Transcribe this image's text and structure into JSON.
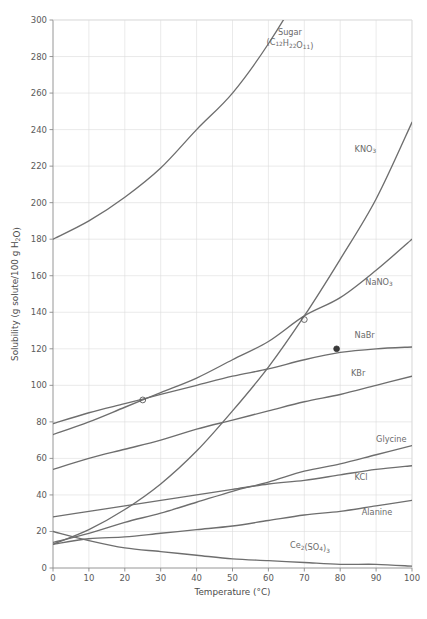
{
  "chart_data": {
    "type": "line",
    "title": "",
    "xlabel": "Temperature (°C)",
    "ylabel": "Solubility (g solute/100 g H₂O)",
    "xlim": [
      0,
      100
    ],
    "ylim": [
      0,
      300
    ],
    "xticks": [
      0,
      10,
      20,
      30,
      40,
      50,
      60,
      70,
      80,
      90,
      100
    ],
    "yticks": [
      0,
      20,
      40,
      60,
      80,
      100,
      120,
      140,
      160,
      180,
      200,
      220,
      240,
      260,
      280,
      300
    ],
    "grid": true,
    "legend_position": "inline-labels",
    "line_color": "#6e6e6e",
    "grid_color": "#dcdcdc",
    "axis_color": "#8a8a8a",
    "series": [
      {
        "name": "Sugar",
        "label_line1": "Sugar",
        "label_line2": "(C12 H22 O11 )",
        "label_formula": "(C₁₂H₂₂O₁₁)",
        "label_x": 66,
        "label_y": 292,
        "x": [
          0,
          10,
          20,
          30,
          40,
          50,
          60,
          70,
          80,
          90,
          100
        ],
        "values": [
          180,
          190,
          203,
          219,
          240,
          260,
          287,
          320,
          360,
          410,
          470
        ]
      },
      {
        "name": "KNO3",
        "label": "KNO₃",
        "label_x": 84,
        "label_y": 228,
        "x": [
          0,
          10,
          20,
          30,
          40,
          50,
          60,
          70,
          80,
          90,
          100
        ],
        "values": [
          13,
          21,
          32,
          46,
          64,
          86,
          110,
          138,
          169,
          202,
          244
        ]
      },
      {
        "name": "NaNO3",
        "label": "NaNO₃",
        "label_x": 87,
        "label_y": 155,
        "x": [
          0,
          10,
          20,
          30,
          40,
          50,
          60,
          70,
          80,
          90,
          100
        ],
        "values": [
          73,
          80,
          88,
          96,
          104,
          114,
          124,
          138,
          148,
          163,
          180
        ]
      },
      {
        "name": "NaBr",
        "label": "NaBr",
        "label_x": 84,
        "label_y": 126,
        "x": [
          0,
          10,
          20,
          30,
          40,
          50,
          60,
          70,
          80,
          90,
          100
        ],
        "values": [
          79,
          85,
          90,
          95,
          100,
          105,
          109,
          114,
          118,
          120,
          121
        ]
      },
      {
        "name": "KBr",
        "label": "KBr",
        "label_x": 83,
        "label_y": 105,
        "x": [
          0,
          10,
          20,
          30,
          40,
          50,
          60,
          70,
          80,
          90,
          100
        ],
        "values": [
          54,
          60,
          65,
          70,
          76,
          81,
          86,
          91,
          95,
          100,
          105
        ]
      },
      {
        "name": "Glycine",
        "label": "Glycine",
        "label_x": 90,
        "label_y": 69,
        "x": [
          0,
          10,
          20,
          30,
          40,
          50,
          60,
          70,
          80,
          90,
          100
        ],
        "values": [
          14,
          19,
          25,
          30,
          36,
          42,
          47,
          53,
          57,
          62,
          67
        ]
      },
      {
        "name": "KCl",
        "label": "KCl",
        "label_x": 84,
        "label_y": 48,
        "x": [
          0,
          10,
          20,
          30,
          40,
          50,
          60,
          70,
          80,
          90,
          100
        ],
        "values": [
          28,
          31,
          34,
          37,
          40,
          43,
          46,
          48,
          51,
          54,
          56
        ]
      },
      {
        "name": "Alanine",
        "label": "Alanine",
        "label_x": 86,
        "label_y": 29,
        "x": [
          0,
          10,
          20,
          30,
          40,
          50,
          60,
          70,
          80,
          90,
          100
        ],
        "values": [
          13,
          16,
          17,
          19,
          21,
          23,
          26,
          29,
          31,
          34,
          37
        ]
      },
      {
        "name": "Ce2(SO4)3",
        "label": "Ce₂(SO₄)₃",
        "label_x": 66,
        "label_y": 11,
        "x": [
          0,
          10,
          20,
          30,
          40,
          50,
          60,
          70,
          80,
          90,
          100
        ],
        "values": [
          20,
          15,
          11,
          9,
          7,
          5,
          4,
          3,
          2,
          2,
          1
        ]
      }
    ],
    "markers": [
      {
        "name": "open-circle-nabr-25",
        "x": 25,
        "y": 92,
        "style": "open"
      },
      {
        "name": "open-circle-intersection-70",
        "x": 70,
        "y": 136,
        "style": "open"
      },
      {
        "name": "filled-dot-nabr-79",
        "x": 79,
        "y": 120,
        "style": "filled"
      }
    ]
  }
}
